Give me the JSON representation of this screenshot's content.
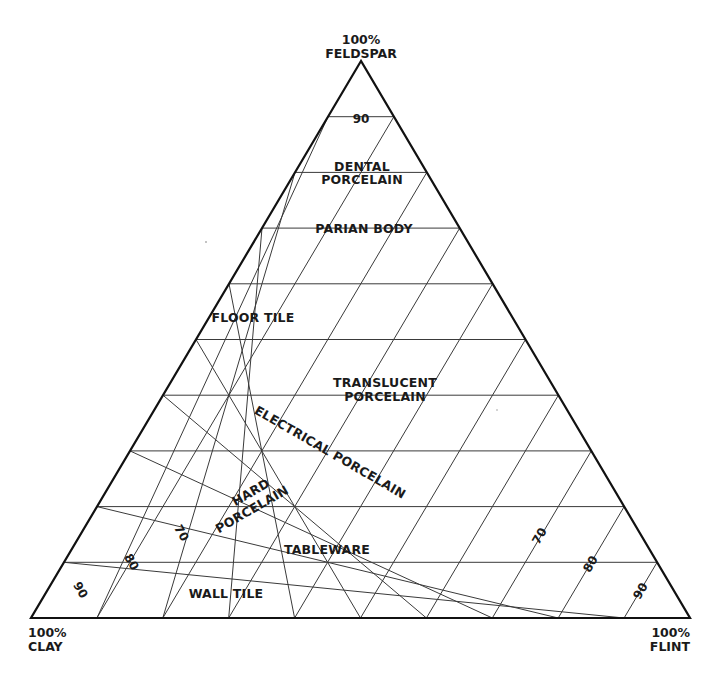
{
  "diagram": {
    "type": "ternary",
    "vertices": {
      "top": {
        "percent": "100%",
        "name": "FELDSPAR"
      },
      "left": {
        "percent": "100%",
        "name": "CLAY"
      },
      "right": {
        "percent": "100%",
        "name": "FLINT"
      }
    },
    "grid_step_percent": 10,
    "tick_labels": {
      "feldspar": [
        "90"
      ],
      "clay": [
        "70",
        "80",
        "90"
      ],
      "flint": [
        "70",
        "80",
        "90"
      ]
    },
    "regions": [
      {
        "id": "dental",
        "lines": [
          "DENTAL",
          "PORCELAIN"
        ]
      },
      {
        "id": "parian",
        "lines": [
          "PARIAN BODY"
        ]
      },
      {
        "id": "floor",
        "lines": [
          "FLOOR TILE"
        ]
      },
      {
        "id": "translucent",
        "lines": [
          "TRANSLUCENT",
          "PORCELAIN"
        ]
      },
      {
        "id": "electrical",
        "lines": [
          "ELECTRICAL PORCELAIN"
        ]
      },
      {
        "id": "hard",
        "lines": [
          "HARD",
          "PORCELAIN"
        ]
      },
      {
        "id": "tableware",
        "lines": [
          "TABLEWARE"
        ]
      },
      {
        "id": "wall",
        "lines": [
          "WALL TILE"
        ]
      }
    ],
    "colors": {
      "ink": "#1a1a1a",
      "background": "#ffffff"
    }
  }
}
